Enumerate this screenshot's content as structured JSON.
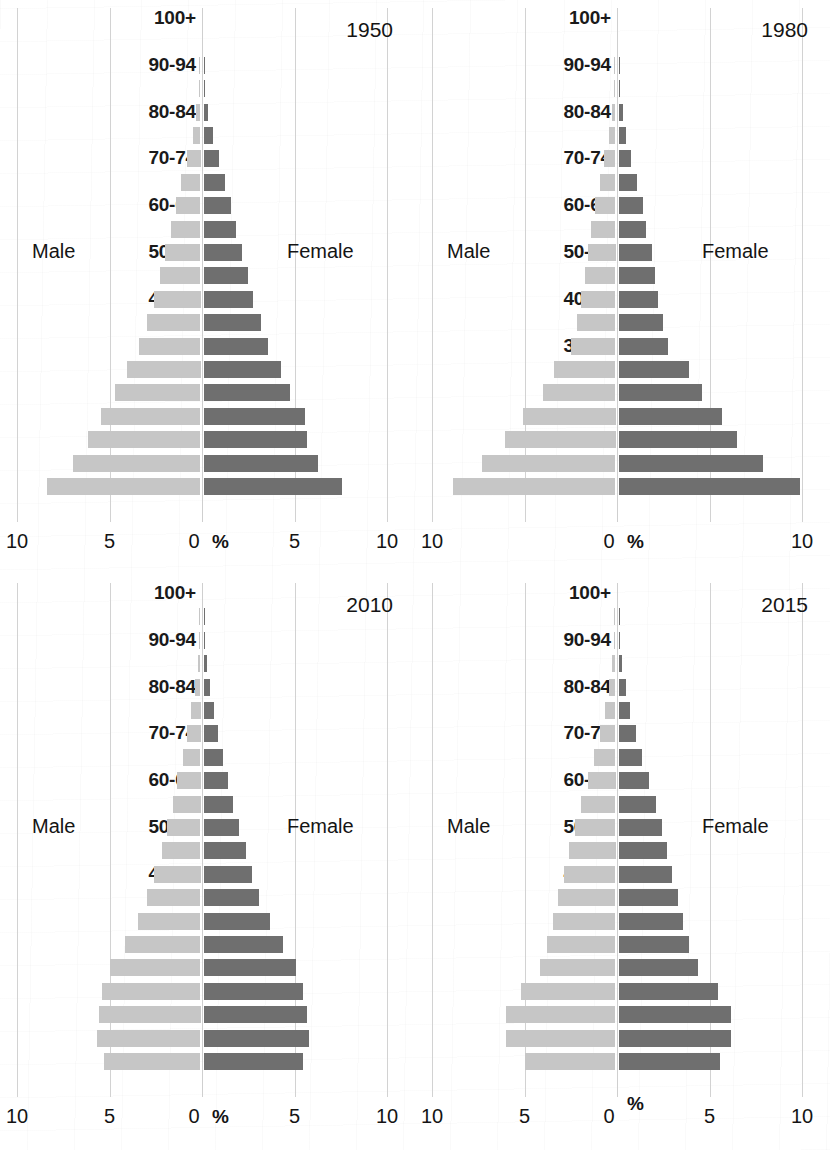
{
  "figure": {
    "kind": "population-pyramid-grid",
    "panel_count": 4,
    "male_label": "Male",
    "female_label": "Female",
    "percent_symbol": "%",
    "male_color": "#c6c6c6",
    "female_color": "#6f6f6f",
    "gridline_color": "#d2d2d2"
  },
  "age_groups": [
    "100+",
    "95-99",
    "90-94",
    "85-89",
    "80-84",
    "75-79",
    "70-74",
    "65-69",
    "60-64",
    "55-59",
    "50-54",
    "45-49",
    "40-44",
    "35-39",
    "30-34",
    "25-29",
    "20-24",
    "15-19",
    "10-14",
    "5-9",
    "0-4"
  ],
  "age_labels_shown": [
    "100+",
    "90-94",
    "80-84",
    "70-74",
    "60-64",
    "50-54",
    "40-44",
    "30-34",
    "20-24",
    "10-14",
    "0-4"
  ],
  "chart_data": [
    {
      "type": "bar",
      "subtype": "population-pyramid",
      "title": "1950",
      "xlabel": "%",
      "ylabel": "",
      "xlim": [
        -10,
        10
      ],
      "xticks": [
        10,
        5,
        0,
        5,
        10
      ],
      "xtick_labels": [
        "10",
        "5",
        "0",
        "5",
        "10"
      ],
      "grid": true,
      "legend_position": "inline-sides",
      "categories": [
        "100+",
        "95-99",
        "90-94",
        "85-89",
        "80-84",
        "75-79",
        "70-74",
        "65-69",
        "60-64",
        "55-59",
        "50-54",
        "45-49",
        "40-44",
        "35-39",
        "30-34",
        "25-29",
        "20-24",
        "15-19",
        "10-14",
        "5-9",
        "0-4"
      ],
      "series": [
        {
          "name": "Male",
          "values": [
            0.0,
            0.0,
            0.02,
            0.08,
            0.22,
            0.42,
            0.75,
            1.05,
            1.35,
            1.6,
            1.9,
            2.2,
            2.5,
            2.9,
            3.3,
            4.0,
            4.6,
            5.4,
            6.1,
            6.9,
            8.3
          ]
        },
        {
          "name": "Female",
          "values": [
            0.0,
            0.0,
            0.02,
            0.1,
            0.25,
            0.5,
            0.85,
            1.15,
            1.5,
            1.75,
            2.1,
            2.4,
            2.7,
            3.1,
            3.5,
            4.2,
            4.7,
            5.5,
            5.6,
            6.2,
            7.5
          ]
        }
      ]
    },
    {
      "type": "bar",
      "subtype": "population-pyramid",
      "title": "1980",
      "xlabel": "%",
      "ylabel": "",
      "xlim": [
        -10,
        10
      ],
      "xticks": [
        10,
        0,
        10
      ],
      "xtick_labels": [
        "10",
        "0",
        "10"
      ],
      "grid": true,
      "legend_position": "inline-sides",
      "categories": [
        "100+",
        "95-99",
        "90-94",
        "85-89",
        "80-84",
        "75-79",
        "70-74",
        "65-69",
        "60-64",
        "55-59",
        "50-54",
        "45-49",
        "40-44",
        "35-39",
        "30-34",
        "25-29",
        "20-24",
        "15-19",
        "10-14",
        "5-9",
        "0-4"
      ],
      "series": [
        {
          "name": "Male",
          "values": [
            0.0,
            0.0,
            0.02,
            0.08,
            0.2,
            0.35,
            0.6,
            0.85,
            1.1,
            1.3,
            1.5,
            1.65,
            1.85,
            2.1,
            2.4,
            3.3,
            3.9,
            5.0,
            6.0,
            7.2,
            8.8
          ]
        },
        {
          "name": "Female",
          "values": [
            0.0,
            0.0,
            0.02,
            0.1,
            0.22,
            0.4,
            0.7,
            1.0,
            1.3,
            1.5,
            1.8,
            1.95,
            2.15,
            2.4,
            2.7,
            3.8,
            4.5,
            5.6,
            6.4,
            7.8,
            9.8
          ]
        }
      ]
    },
    {
      "type": "bar",
      "subtype": "population-pyramid",
      "title": "2010",
      "xlabel": "%",
      "ylabel": "",
      "xlim": [
        -10,
        10
      ],
      "xticks": [
        10,
        5,
        0,
        5,
        10
      ],
      "xtick_labels": [
        "10",
        "5",
        "0",
        "5",
        "10"
      ],
      "grid": true,
      "legend_position": "inline-sides",
      "categories": [
        "100+",
        "95-99",
        "90-94",
        "85-89",
        "80-84",
        "75-79",
        "70-74",
        "65-69",
        "60-64",
        "55-59",
        "50-54",
        "45-49",
        "40-44",
        "35-39",
        "30-34",
        "25-29",
        "20-24",
        "15-19",
        "10-14",
        "5-9",
        "0-4"
      ],
      "series": [
        {
          "name": "Male",
          "values": [
            0.0,
            0.01,
            0.05,
            0.15,
            0.3,
            0.5,
            0.75,
            0.95,
            1.25,
            1.5,
            1.8,
            2.1,
            2.5,
            2.9,
            3.4,
            4.1,
            4.9,
            5.3,
            5.5,
            5.6,
            5.2
          ]
        },
        {
          "name": "Female",
          "values": [
            0.0,
            0.01,
            0.06,
            0.18,
            0.35,
            0.55,
            0.8,
            1.05,
            1.35,
            1.6,
            1.9,
            2.3,
            2.6,
            3.0,
            3.6,
            4.3,
            5.0,
            5.4,
            5.6,
            5.7,
            5.4
          ]
        }
      ]
    },
    {
      "type": "bar",
      "subtype": "population-pyramid",
      "title": "2015",
      "xlabel": "%",
      "ylabel": "",
      "xlim": [
        -10,
        10
      ],
      "xticks": [
        10,
        5,
        0,
        5,
        10
      ],
      "xtick_labels": [
        "10",
        "5",
        "0",
        "5",
        "10"
      ],
      "grid": true,
      "legend_position": "inline-sides",
      "categories": [
        "100+",
        "95-99",
        "90-94",
        "85-89",
        "80-84",
        "75-79",
        "70-74",
        "65-69",
        "60-64",
        "55-59",
        "50-54",
        "45-49",
        "40-44",
        "35-39",
        "30-34",
        "25-29",
        "20-24",
        "15-19",
        "10-14",
        "5-9",
        "0-4"
      ],
      "series": [
        {
          "name": "Male",
          "values": [
            0.0,
            0.01,
            0.06,
            0.18,
            0.35,
            0.55,
            0.85,
            1.15,
            1.5,
            1.85,
            2.2,
            2.5,
            2.8,
            3.1,
            3.4,
            3.7,
            4.1,
            5.1,
            5.9,
            5.9,
            4.9
          ]
        },
        {
          "name": "Female",
          "values": [
            0.0,
            0.01,
            0.07,
            0.2,
            0.4,
            0.62,
            0.95,
            1.25,
            1.65,
            2.0,
            2.35,
            2.6,
            2.9,
            3.2,
            3.5,
            3.8,
            4.3,
            5.4,
            6.1,
            6.1,
            5.5
          ]
        }
      ]
    }
  ]
}
